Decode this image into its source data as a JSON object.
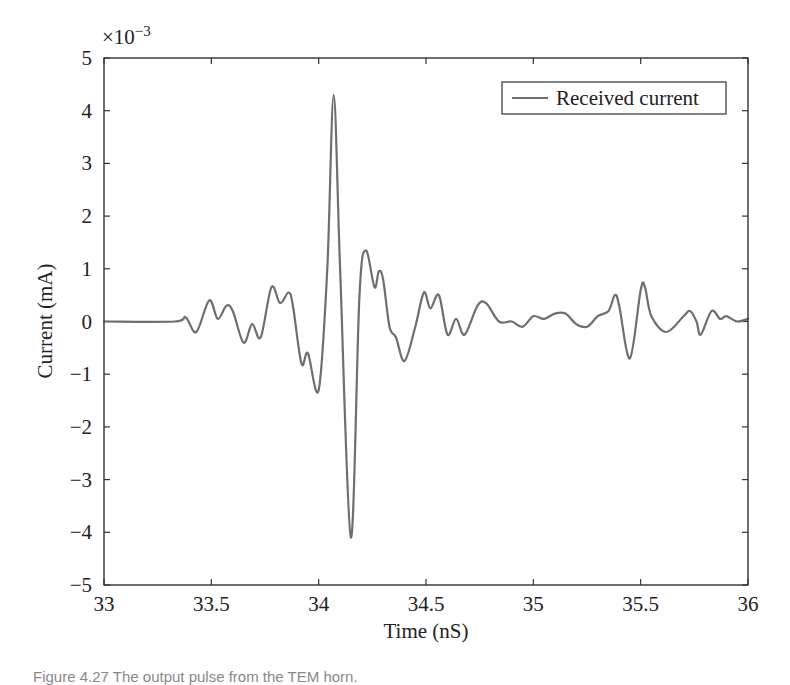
{
  "chart_data": {
    "type": "line",
    "title": "",
    "xlabel": "Time (nS)",
    "ylabel": "Current (mA)",
    "y_multiplier": "×10^-3",
    "xlim": [
      33,
      36
    ],
    "ylim": [
      -5,
      5
    ],
    "x_ticks": [
      33,
      33.5,
      34,
      34.5,
      35,
      35.5,
      36
    ],
    "x_tick_labels": [
      "33",
      "33.5",
      "34",
      "34.5",
      "35",
      "35.5",
      "36"
    ],
    "y_ticks": [
      -5,
      -4,
      -3,
      -2,
      -1,
      0,
      1,
      2,
      3,
      4,
      5
    ],
    "y_tick_labels": [
      "−5",
      "−4",
      "−3",
      "−2",
      "−1",
      "0",
      "1",
      "2",
      "3",
      "4",
      "5"
    ],
    "grid": false,
    "legend_position": "upper right",
    "series": [
      {
        "name": "Received current",
        "color": "#6e6e6e",
        "x": [
          33.0,
          33.33,
          33.38,
          33.43,
          33.49,
          33.53,
          33.57,
          33.6,
          33.65,
          33.69,
          33.73,
          33.78,
          33.82,
          33.86,
          33.88,
          33.92,
          33.95,
          34.0,
          34.04,
          34.07,
          34.1,
          34.15,
          34.19,
          34.22,
          34.26,
          34.28,
          34.3,
          34.33,
          34.36,
          34.4,
          34.45,
          34.49,
          34.52,
          34.56,
          34.6,
          34.64,
          34.68,
          34.74,
          34.78,
          34.84,
          34.9,
          34.95,
          35.0,
          35.05,
          35.1,
          35.15,
          35.2,
          35.25,
          35.3,
          35.35,
          35.38,
          35.4,
          35.45,
          35.5,
          35.52,
          35.55,
          35.62,
          35.7,
          35.73,
          35.76,
          35.78,
          35.83,
          35.87,
          35.9,
          35.95,
          36.0
        ],
        "y": [
          0,
          0,
          0.08,
          -0.2,
          0.4,
          0.05,
          0.3,
          0.2,
          -0.4,
          -0.05,
          -0.3,
          0.65,
          0.35,
          0.55,
          0.3,
          -0.8,
          -0.6,
          -1.3,
          1.0,
          4.3,
          1.0,
          -4.1,
          0.5,
          1.35,
          0.65,
          0.95,
          0.8,
          -0.1,
          -0.3,
          -0.75,
          -0.1,
          0.55,
          0.25,
          0.5,
          -0.25,
          0.05,
          -0.25,
          0.3,
          0.35,
          0,
          0,
          -0.1,
          0.1,
          0.05,
          0.15,
          0.15,
          -0.05,
          -0.1,
          0.1,
          0.2,
          0.5,
          0.3,
          -0.7,
          0.6,
          0.65,
          0.1,
          -0.2,
          0.1,
          0.2,
          0,
          -0.25,
          0.2,
          0.05,
          0.1,
          0,
          0.05
        ]
      }
    ]
  },
  "legend": {
    "label": "Received current"
  },
  "axes": {
    "multiplier_label": "×10",
    "multiplier_exp": "−3",
    "xlabel": "Time (nS)",
    "ylabel": "Current (mA)"
  },
  "caption": "Figure 4.27  The output pulse from the TEM horn."
}
